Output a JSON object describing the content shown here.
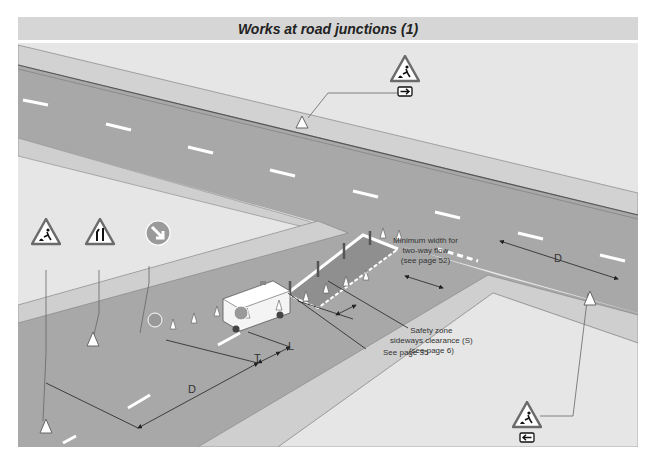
{
  "title": "Works at road junctions (1)",
  "colors": {
    "banner_bg": "#d6d6d6",
    "verge": "#e4e4e4",
    "road": "#a9a9a9",
    "footway": "#cfcfcf",
    "sign_border": "#6b6b6b",
    "sign_fill": "#ffffff",
    "line": "#333333"
  },
  "labels": {
    "min_width": [
      "Minimum width for",
      "two-way flow",
      "(see page 52)"
    ],
    "safety_zone": [
      "Safety zone",
      "sideways clearance (S)",
      "(see page 6)"
    ],
    "see_page": "See page 35"
  },
  "dimensions": {
    "d_main": "D",
    "d_side": "D",
    "t": "T",
    "l": "L"
  },
  "signs": [
    {
      "id": "roadworks-right",
      "type": "warning-triangle",
      "symbol": "roadworks-man-digging",
      "plate": "arrow-right"
    },
    {
      "id": "roadworks-main",
      "type": "warning-triangle",
      "symbol": "roadworks-man-digging"
    },
    {
      "id": "road-narrows",
      "type": "warning-triangle",
      "symbol": "road-narrows-right"
    },
    {
      "id": "keep-right",
      "type": "circular-blue",
      "symbol": "arrow-down-right"
    },
    {
      "id": "roadworks-left",
      "type": "warning-triangle",
      "symbol": "roadworks-man-digging",
      "plate": "arrow-left"
    }
  ]
}
